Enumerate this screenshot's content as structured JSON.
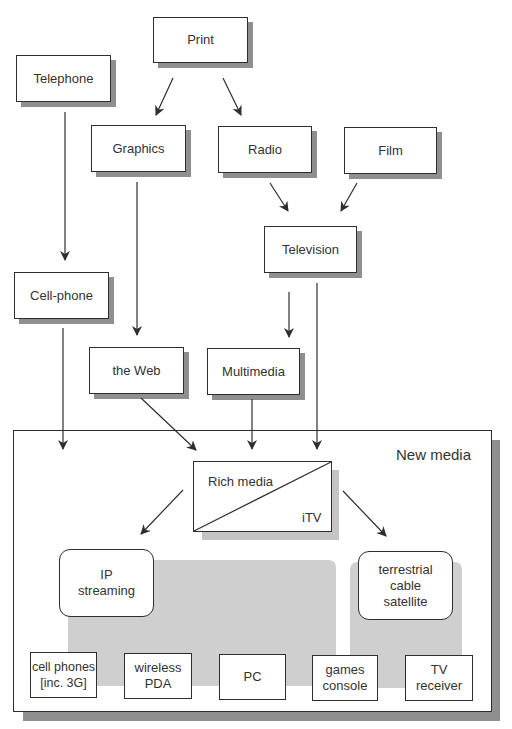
{
  "diagram": {
    "nodes": {
      "print": "Print",
      "telephone": "Telephone",
      "graphics": "Graphics",
      "radio": "Radio",
      "film": "Film",
      "television": "Television",
      "cellphone": "Cell-phone",
      "web": "the Web",
      "multimedia": "Multimedia"
    },
    "new_media": {
      "title": "New media",
      "rich_media": {
        "upper_label": "Rich media",
        "lower_label": "iTV"
      },
      "distribution": {
        "ip_streaming": [
          "IP",
          "streaming"
        ],
        "broadcast": [
          "terrestrial",
          "cable",
          "satellite"
        ]
      },
      "devices": [
        {
          "line1": "cell phones",
          "line2": "[inc. 3G]"
        },
        {
          "line1": "wireless",
          "line2": "PDA"
        },
        {
          "line1": "PC",
          "line2": ""
        },
        {
          "line1": "games",
          "line2": "console"
        },
        {
          "line1": "TV",
          "line2": "receiver"
        }
      ]
    },
    "edges": [
      {
        "from": "Print",
        "to": "Graphics"
      },
      {
        "from": "Print",
        "to": "Radio"
      },
      {
        "from": "Radio",
        "to": "Television"
      },
      {
        "from": "Film",
        "to": "Television"
      },
      {
        "from": "Telephone",
        "to": "Cell-phone"
      },
      {
        "from": "Graphics",
        "to": "the Web"
      },
      {
        "from": "Television",
        "to": "Multimedia"
      },
      {
        "from": "Cell-phone",
        "to": "New media"
      },
      {
        "from": "the Web",
        "to": "Rich media"
      },
      {
        "from": "Multimedia",
        "to": "Rich media"
      },
      {
        "from": "Television",
        "to": "Rich media / iTV"
      },
      {
        "from": "Rich media",
        "to": "IP streaming"
      },
      {
        "from": "Rich media / iTV",
        "to": "terrestrial cable satellite"
      }
    ],
    "colors": {
      "line": "#2e2e2e",
      "shadow": "#8f8f8f",
      "light_shadow": "#c4c4c4",
      "grey_region": "#cfcfcf",
      "background": "#ffffff"
    }
  }
}
